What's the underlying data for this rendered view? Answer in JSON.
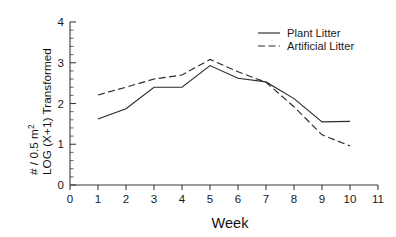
{
  "chart_data": {
    "type": "line",
    "title": "",
    "subtitle": "",
    "xlabel": "Week",
    "ylabel_line1": "# / 0.5 m",
    "ylabel_line1_sup": "2",
    "ylabel_line2": "LOG (X+1) Transformed",
    "xlim": [
      0,
      11
    ],
    "ylim": [
      0,
      4
    ],
    "grid": false,
    "legend_position": "top-right",
    "x_ticks": [
      0,
      1,
      2,
      3,
      4,
      5,
      6,
      7,
      8,
      9,
      10,
      11
    ],
    "x_tick_labels": [
      "0",
      "1",
      "2",
      "3",
      "4",
      "5",
      "6",
      "7",
      "8",
      "9",
      "10",
      "11"
    ],
    "y_ticks": [
      0,
      1,
      2,
      3,
      4
    ],
    "y_tick_labels": [
      "0",
      "1",
      "2",
      "3",
      "4"
    ],
    "y_minor_tick_step": 0.2,
    "x": [
      1,
      2,
      3,
      4,
      5,
      6,
      7,
      8,
      9,
      10
    ],
    "series": [
      {
        "name": "Plant Litter",
        "style": "solid",
        "color": "#2b2b2b",
        "x": [
          1,
          2,
          3,
          4,
          5,
          6,
          7,
          8,
          9,
          10
        ],
        "values": [
          1.62,
          1.87,
          2.4,
          2.4,
          2.93,
          2.62,
          2.53,
          2.12,
          1.55,
          1.56
        ]
      },
      {
        "name": "Artificial Litter",
        "style": "dashed",
        "color": "#2b2b2b",
        "x": [
          1,
          2,
          3,
          4,
          5,
          6,
          7,
          8,
          9,
          10
        ],
        "values": [
          2.21,
          2.4,
          2.6,
          2.7,
          3.08,
          2.78,
          2.52,
          1.92,
          1.23,
          0.96
        ]
      }
    ]
  },
  "legend": {
    "entries": [
      {
        "label": "Plant Litter",
        "style": "solid"
      },
      {
        "label": "Artificial Litter",
        "style": "dashed"
      }
    ]
  }
}
